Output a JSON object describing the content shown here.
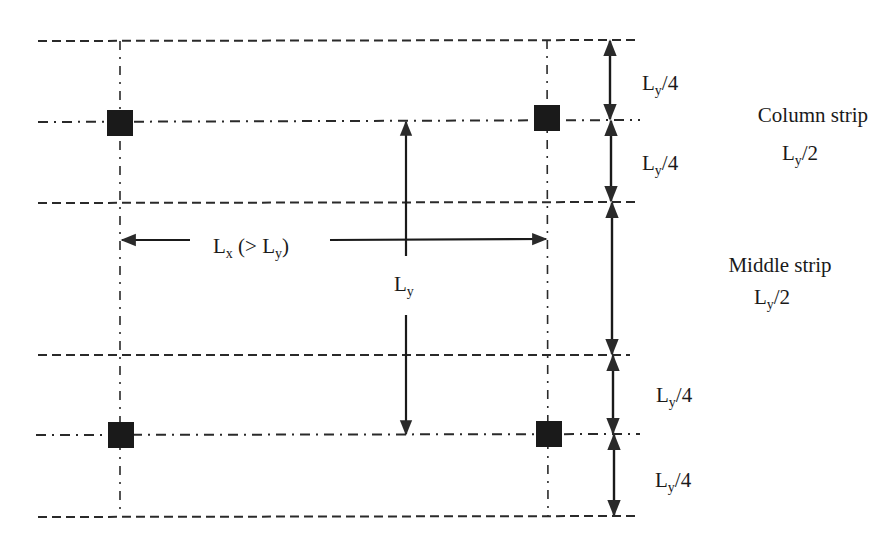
{
  "diagram": {
    "colors": {
      "line": "#2a2a2a",
      "column": "#1a1a1a",
      "text": "#1a1a1a",
      "background": "#ffffff"
    },
    "dimensions": {
      "lx": {
        "main": "L",
        "sub": "x",
        "rest": " (> L",
        "sub2": "y",
        "close": ")"
      },
      "ly": {
        "main": "L",
        "sub": "y"
      },
      "right": [
        {
          "main": "L",
          "sub": "y",
          "rest": "/4"
        },
        {
          "main": "L",
          "sub": "y",
          "rest": "/4"
        },
        {
          "main": "L",
          "sub": "y",
          "rest": "/4"
        },
        {
          "main": "L",
          "sub": "y",
          "rest": "/4"
        }
      ]
    },
    "strips": {
      "column": {
        "name": "Column strip",
        "main": "L",
        "sub": "y",
        "rest": "/2"
      },
      "middle": {
        "name": "Middle strip",
        "main": "L",
        "sub": "y",
        "rest": "/2"
      }
    },
    "columns": [
      {
        "label": "column-top-left"
      },
      {
        "label": "column-top-right"
      },
      {
        "label": "column-bottom-left"
      },
      {
        "label": "column-bottom-right"
      }
    ]
  }
}
